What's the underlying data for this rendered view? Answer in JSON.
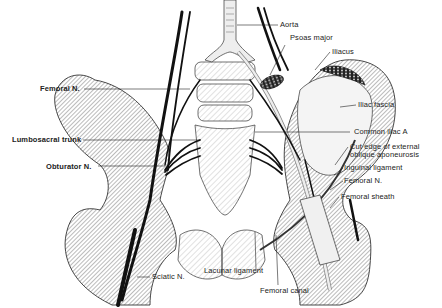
{
  "figure": {
    "labels_left": [
      {
        "id": "femoral-n-left",
        "text": "Femoral N."
      },
      {
        "id": "lumbosacral-trunk",
        "text": "Lumbosacral trunk"
      },
      {
        "id": "obturator-n",
        "text": "Obturator N."
      }
    ],
    "labels_right": [
      {
        "id": "aorta",
        "text": "Aorta"
      },
      {
        "id": "psoas-major",
        "text": "Psoas major"
      },
      {
        "id": "iliacus",
        "text": "Iliacus"
      },
      {
        "id": "iliac-fascia",
        "text": "Iliac fascia"
      },
      {
        "id": "common-iliac-a",
        "text": "Common iliac A"
      },
      {
        "id": "cut-edge",
        "text": "Cut edge of external oblique aponeurosis"
      },
      {
        "id": "inguinal-ligament",
        "text": "Inguinal ligament"
      },
      {
        "id": "femoral-n-right",
        "text": "Femoral N."
      },
      {
        "id": "femoral-sheath",
        "text": "Femoral sheath"
      }
    ],
    "labels_bottom": [
      {
        "id": "sciatic-n",
        "text": "Sciatic N."
      },
      {
        "id": "lacunar-ligament",
        "text": "Lacunar ligament"
      },
      {
        "id": "femoral-canal",
        "text": "Femoral canal"
      }
    ]
  }
}
